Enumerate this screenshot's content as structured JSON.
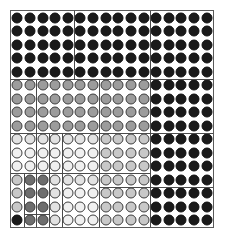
{
  "figure": {
    "name": "grayscale-circle-grid-matrix",
    "rows": 16,
    "cols": 16,
    "cell_size": 12.75,
    "disc_diameter": 11,
    "background_color": "#ffffff",
    "frame_color": "#5a5a5a",
    "partition_color": "#4a4a4a",
    "disc_outline_color": "#3d3d3d"
  },
  "palette": {
    "black": "#1a1a1a",
    "dark_gray": "#6e6e6e",
    "mid_gray": "#9c9c9c",
    "light_gray": "#c8c8c8",
    "pale_gray": "#e2e2e2",
    "near_white": "#f0f0f0"
  },
  "chart_data": {
    "type": "heatmap",
    "title": "",
    "xlabel": "",
    "ylabel": "",
    "rows": 16,
    "cols": 16,
    "grid": true,
    "legend": "none",
    "value_scale": [
      "near_white",
      "pale_gray",
      "light_gray",
      "mid_gray",
      "dark_gray",
      "black"
    ],
    "cells": [
      [
        "black",
        "black",
        "black",
        "black",
        "black",
        "black",
        "black",
        "black",
        "black",
        "black",
        "black",
        "black",
        "black",
        "black",
        "black",
        "black"
      ],
      [
        "black",
        "black",
        "black",
        "black",
        "black",
        "black",
        "black",
        "black",
        "black",
        "black",
        "black",
        "black",
        "black",
        "black",
        "black",
        "black"
      ],
      [
        "black",
        "black",
        "black",
        "black",
        "black",
        "black",
        "black",
        "black",
        "black",
        "black",
        "black",
        "black",
        "black",
        "black",
        "black",
        "black"
      ],
      [
        "black",
        "black",
        "black",
        "black",
        "black",
        "black",
        "black",
        "black",
        "black",
        "black",
        "black",
        "black",
        "black",
        "black",
        "black",
        "black"
      ],
      [
        "black",
        "black",
        "black",
        "black",
        "black",
        "black",
        "black",
        "black",
        "black",
        "black",
        "black",
        "black",
        "black",
        "black",
        "black",
        "black"
      ],
      [
        "mid_gray",
        "mid_gray",
        "mid_gray",
        "mid_gray",
        "mid_gray",
        "mid_gray",
        "mid_gray",
        "mid_gray",
        "mid_gray",
        "mid_gray",
        "mid_gray",
        "black",
        "black",
        "black",
        "black",
        "black"
      ],
      [
        "mid_gray",
        "mid_gray",
        "mid_gray",
        "mid_gray",
        "mid_gray",
        "mid_gray",
        "mid_gray",
        "mid_gray",
        "mid_gray",
        "mid_gray",
        "mid_gray",
        "black",
        "black",
        "black",
        "black",
        "black"
      ],
      [
        "mid_gray",
        "mid_gray",
        "mid_gray",
        "mid_gray",
        "mid_gray",
        "mid_gray",
        "mid_gray",
        "mid_gray",
        "mid_gray",
        "mid_gray",
        "mid_gray",
        "black",
        "black",
        "black",
        "black",
        "black"
      ],
      [
        "mid_gray",
        "mid_gray",
        "mid_gray",
        "mid_gray",
        "mid_gray",
        "mid_gray",
        "mid_gray",
        "mid_gray",
        "mid_gray",
        "mid_gray",
        "mid_gray",
        "black",
        "black",
        "black",
        "black",
        "black"
      ],
      [
        "pale_gray",
        "pale_gray",
        "pale_gray",
        "pale_gray",
        "pale_gray",
        "pale_gray",
        "pale_gray",
        "light_gray",
        "light_gray",
        "light_gray",
        "light_gray",
        "black",
        "black",
        "black",
        "black",
        "black"
      ],
      [
        "near_white",
        "near_white",
        "near_white",
        "near_white",
        "near_white",
        "near_white",
        "near_white",
        "light_gray",
        "light_gray",
        "light_gray",
        "light_gray",
        "black",
        "black",
        "black",
        "black",
        "black"
      ],
      [
        "near_white",
        "near_white",
        "near_white",
        "near_white",
        "near_white",
        "near_white",
        "near_white",
        "light_gray",
        "light_gray",
        "light_gray",
        "light_gray",
        "black",
        "black",
        "black",
        "black",
        "black"
      ],
      [
        "light_gray",
        "dark_gray",
        "dark_gray",
        "pale_gray",
        "pale_gray",
        "pale_gray",
        "pale_gray",
        "light_gray",
        "light_gray",
        "light_gray",
        "light_gray",
        "black",
        "black",
        "black",
        "black",
        "black"
      ],
      [
        "light_gray",
        "dark_gray",
        "dark_gray",
        "pale_gray",
        "near_white",
        "near_white",
        "near_white",
        "light_gray",
        "light_gray",
        "light_gray",
        "light_gray",
        "black",
        "black",
        "black",
        "black",
        "black"
      ],
      [
        "light_gray",
        "dark_gray",
        "dark_gray",
        "pale_gray",
        "near_white",
        "near_white",
        "near_white",
        "light_gray",
        "light_gray",
        "light_gray",
        "light_gray",
        "black",
        "black",
        "black",
        "black",
        "black"
      ],
      [
        "black",
        "dark_gray",
        "dark_gray",
        "pale_gray",
        "near_white",
        "near_white",
        "near_white",
        "light_gray",
        "light_gray",
        "light_gray",
        "light_gray",
        "black",
        "black",
        "black",
        "black",
        "black"
      ]
    ],
    "partitions": {
      "horizontal": [
        {
          "name": "h-major-row5",
          "row": 5,
          "col_start": 0,
          "col_end": 16
        },
        {
          "name": "h-row9",
          "row": 9,
          "col_start": 0,
          "col_end": 11
        },
        {
          "name": "h-row9-right",
          "row": 9,
          "col_start": 11,
          "col_end": 16
        },
        {
          "name": "h-row12",
          "row": 12,
          "col_start": 0,
          "col_end": 11
        },
        {
          "name": "h-row13-mid",
          "row": 13,
          "col_start": 7,
          "col_end": 11
        },
        {
          "name": "h-row13-right",
          "row": 13,
          "col_start": 11,
          "col_end": 16
        },
        {
          "name": "h-row15-left",
          "row": 15,
          "col_start": 1,
          "col_end": 3
        }
      ],
      "vertical": [
        {
          "name": "v-major-col11",
          "col": 11,
          "row_start": 0,
          "row_end": 16
        },
        {
          "name": "v-col5-top",
          "col": 5,
          "row_start": 0,
          "row_end": 5
        },
        {
          "name": "v-col7-upper",
          "col": 7,
          "row_start": 5,
          "row_end": 9
        },
        {
          "name": "v-col2-mid",
          "col": 2,
          "row_start": 5,
          "row_end": 16
        },
        {
          "name": "v-col4-lower",
          "col": 4,
          "row_start": 9,
          "row_end": 16
        },
        {
          "name": "v-col7-lower",
          "col": 7,
          "row_start": 9,
          "row_end": 16
        },
        {
          "name": "v-col1-bottom",
          "col": 1,
          "row_start": 12,
          "row_end": 16
        },
        {
          "name": "v-col3-bottom",
          "col": 3,
          "row_start": 9,
          "row_end": 16
        }
      ]
    }
  }
}
